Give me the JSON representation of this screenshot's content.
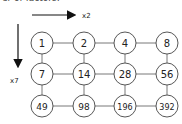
{
  "caption": "er of factors:",
  "arrows": {
    "horizontal_label": "x2",
    "vertical_label": "x7"
  },
  "grid": {
    "rows": [
      [
        "1",
        "2",
        "4",
        "8"
      ],
      [
        "7",
        "14",
        "28",
        "56"
      ],
      [
        "49",
        "98",
        "196",
        "392"
      ]
    ]
  }
}
